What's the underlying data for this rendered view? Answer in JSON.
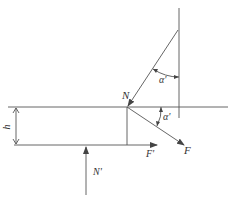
{
  "diagram": {
    "type": "force-diagram",
    "stroke_color": "#555555",
    "labels": {
      "N": "N",
      "F": "F",
      "F_prime": "F'",
      "N_prime": "N'",
      "h": "h",
      "alpha_upper": "α'",
      "alpha_lower": "α'"
    }
  }
}
